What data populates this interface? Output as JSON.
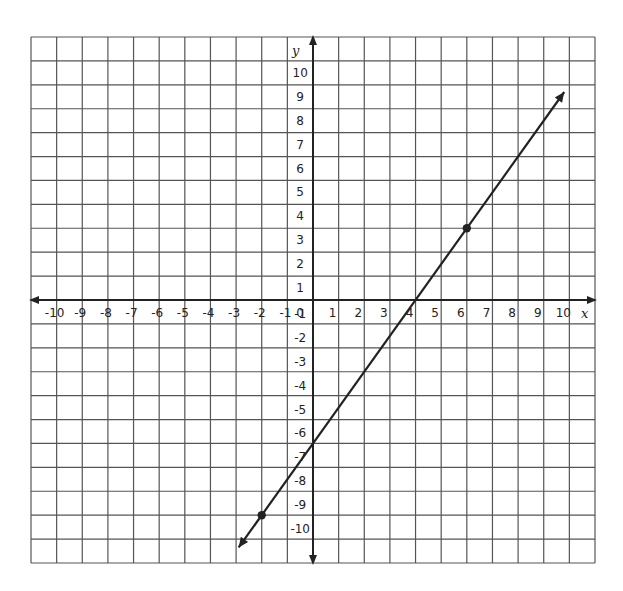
{
  "chart_data": {
    "type": "line",
    "title": "",
    "xlabel": "x",
    "ylabel": "y",
    "xlim": [
      -10,
      10
    ],
    "ylim": [
      -10,
      10
    ],
    "grid": true,
    "x_ticks": [
      -10,
      -9,
      -8,
      -7,
      -6,
      -5,
      -4,
      -3,
      -2,
      -1,
      0,
      1,
      2,
      3,
      4,
      5,
      6,
      7,
      8,
      9,
      10
    ],
    "y_ticks": [
      10,
      9,
      8,
      7,
      6,
      5,
      4,
      3,
      2,
      1,
      -1,
      -2,
      -3,
      -4,
      -5,
      -6,
      -7,
      -8,
      -9,
      -10
    ],
    "series": [
      {
        "name": "line",
        "equation": "y = 1.5x - 6",
        "slope": 1.5,
        "intercept": -6,
        "x_range": [
          -2.9,
          9.8
        ],
        "arrows_both_ends": true,
        "color": "#222222"
      }
    ],
    "points": [
      {
        "x": 6,
        "y": 3
      },
      {
        "x": -2,
        "y": -9
      }
    ]
  },
  "colors": {
    "grid": "#555555",
    "axis": "#222222",
    "line": "#222222",
    "background": "#ffffff"
  }
}
